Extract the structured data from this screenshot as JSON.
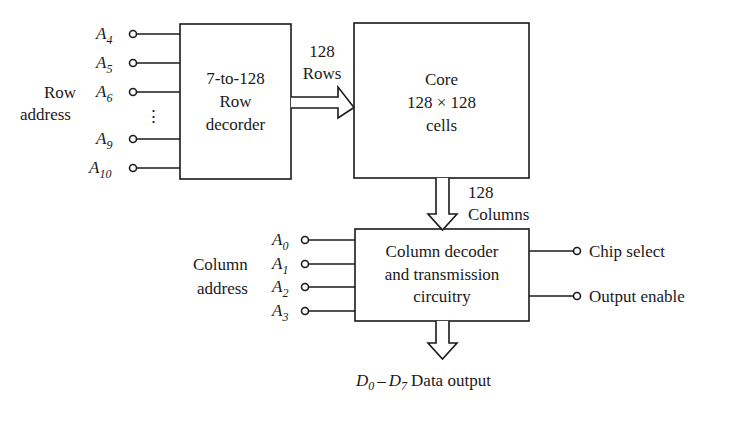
{
  "row_address": {
    "label_line1": "Row",
    "label_line2": "address",
    "inputs": [
      {
        "name": "A",
        "sub": "4"
      },
      {
        "name": "A",
        "sub": "5"
      },
      {
        "name": "A",
        "sub": "6"
      },
      {
        "name": "A",
        "sub": "9"
      },
      {
        "name": "A",
        "sub": "10"
      }
    ],
    "ellipsis": "⋮"
  },
  "row_decoder": {
    "line1": "7-to-128",
    "line2": "Row",
    "line3": "decorder"
  },
  "row_bus": {
    "count": "128",
    "label": "Rows"
  },
  "core": {
    "line1": "Core",
    "line2": "128 × 128",
    "line3": "cells"
  },
  "column_bus": {
    "count": "128",
    "label": "Columns"
  },
  "column_address": {
    "label_line1": "Column",
    "label_line2": "address",
    "inputs": [
      {
        "name": "A",
        "sub": "0"
      },
      {
        "name": "A",
        "sub": "1"
      },
      {
        "name": "A",
        "sub": "2"
      },
      {
        "name": "A",
        "sub": "3"
      }
    ]
  },
  "column_decoder": {
    "line1": "Column decoder",
    "line2": "and transmission",
    "line3": "circuitry"
  },
  "control_outputs": {
    "chip_select": "Chip select",
    "output_enable": "Output enable"
  },
  "data_output": {
    "d_start": "D",
    "d_start_sub": "0",
    "dash": "–",
    "d_end": "D",
    "d_end_sub": "7",
    "label": "Data output"
  }
}
